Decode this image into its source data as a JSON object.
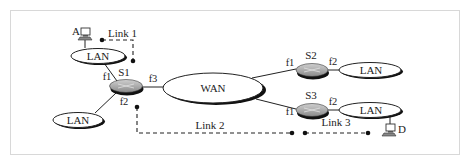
{
  "diagram": {
    "hosts": [
      {
        "id": "A",
        "label": "A"
      },
      {
        "id": "D",
        "label": "D"
      }
    ],
    "switches": [
      {
        "id": "S1",
        "label": "S1",
        "ports": {
          "f1": "f1",
          "f2": "f2",
          "f3": "f3"
        }
      },
      {
        "id": "S2",
        "label": "S2",
        "ports": {
          "f1": "f1",
          "f2": "f2"
        }
      },
      {
        "id": "S3",
        "label": "S3",
        "ports": {
          "f1": "f1",
          "f2": "f2"
        }
      }
    ],
    "networks": [
      {
        "id": "lan-a",
        "label": "LAN"
      },
      {
        "id": "lan-s1-f2",
        "label": "LAN"
      },
      {
        "id": "lan-s2",
        "label": "LAN"
      },
      {
        "id": "lan-d",
        "label": "LAN"
      },
      {
        "id": "wan",
        "label": "WAN"
      }
    ],
    "links": [
      {
        "id": "link1",
        "label": "Link 1"
      },
      {
        "id": "link2",
        "label": "Link 2"
      },
      {
        "id": "link3",
        "label": "Link 3"
      }
    ],
    "colors": {
      "switch_fill": "#a8a8a8",
      "switch_shadow": "#111111",
      "line": "#222222",
      "frame": "#d8d8d8"
    }
  }
}
